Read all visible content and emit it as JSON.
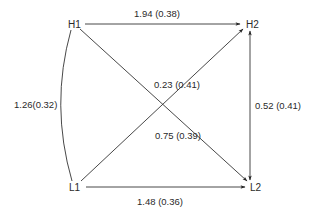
{
  "diagram": {
    "type": "path-diagram",
    "nodes": [
      {
        "id": "H1",
        "label": "H1",
        "x": 75,
        "y": 24
      },
      {
        "id": "H2",
        "label": "H2",
        "x": 250,
        "y": 24
      },
      {
        "id": "L1",
        "label": "L1",
        "x": 76,
        "y": 188
      },
      {
        "id": "L2",
        "label": "L2",
        "x": 254,
        "y": 188
      }
    ],
    "edges": [
      {
        "from": "H1",
        "to": "H2",
        "label": "1.94 (0.38)",
        "directed": true
      },
      {
        "from": "L1",
        "to": "L2",
        "label": "1.48 (0.36)",
        "directed": true
      },
      {
        "from": "L1",
        "to": "H2",
        "label": "0.23 (0.41)",
        "directed": true
      },
      {
        "from": "H1",
        "to": "L2",
        "label": "0.75 (0.39)",
        "directed": true
      },
      {
        "from": "H2",
        "to": "L2",
        "label": "0.52 (0.41)",
        "directed": "both"
      },
      {
        "from": "H1",
        "to": "L1",
        "label": "1.26(0.32)",
        "directed": false,
        "curved": true
      }
    ]
  },
  "labels": {
    "H1": "H1",
    "H2": "H2",
    "L1": "L1",
    "L2": "L2",
    "e_h1_h2": "1.94 (0.38)",
    "e_l1_l2": "1.48 (0.36)",
    "e_l1_h2": "0.23 (0.41)",
    "e_h1_l2": "0.75 (0.39)",
    "e_h2_l2": "0.52 (0.41)",
    "e_h1_l1": "1.26(0.32)"
  },
  "colors": {
    "line": "#333333",
    "text": "#2a2a2a",
    "background": "#ffffff"
  }
}
